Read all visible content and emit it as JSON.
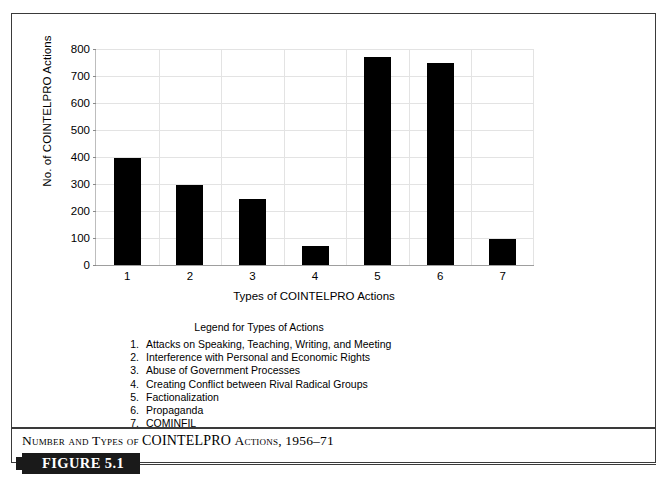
{
  "figure": {
    "tag_label": "FIGURE 5.1",
    "caption_prefix": "Number and Types of",
    "caption_acronym": "COINTELPRO",
    "caption_suffix": "Actions, 1956–71"
  },
  "chart_data": {
    "type": "bar",
    "title": "",
    "xlabel": "Types of COINTELPRO Actions",
    "ylabel": "No. of COINTELPRO Actions",
    "categories": [
      "1",
      "2",
      "3",
      "4",
      "5",
      "6",
      "7"
    ],
    "values": [
      397,
      297,
      245,
      70,
      770,
      748,
      98
    ],
    "ylim": [
      0,
      800
    ],
    "yticks": [
      0,
      100,
      200,
      300,
      400,
      500,
      600,
      700,
      800
    ],
    "ytick_labels": [
      "0",
      "100",
      "200",
      "300",
      "400",
      "500",
      "600",
      "700",
      "800"
    ],
    "grid": "both",
    "legend_position": "below-chart",
    "bar_color": "#000000",
    "gridline_color": "#e3e3e3",
    "series": [
      {
        "name": "No. of COINTELPRO Actions",
        "values": [
          397,
          297,
          245,
          70,
          770,
          748,
          98
        ]
      }
    ]
  },
  "legend": {
    "title": "Legend for Types of Actions",
    "items": [
      {
        "num": "1.",
        "label": "Attacks on Speaking, Teaching, Writing, and Meeting"
      },
      {
        "num": "2.",
        "label": "Interference with Personal and Economic Rights"
      },
      {
        "num": "3.",
        "label": "Abuse of Government Processes"
      },
      {
        "num": "4.",
        "label": "Creating Conflict between Rival Radical Groups"
      },
      {
        "num": "5.",
        "label": "Factionalization"
      },
      {
        "num": "6.",
        "label": "Propaganda"
      },
      {
        "num": "7.",
        "label": "COMINFIL"
      }
    ]
  }
}
